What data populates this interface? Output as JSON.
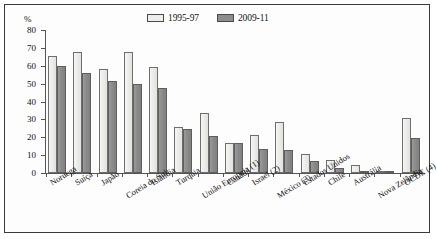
{
  "axis": {
    "unit_label": "%",
    "y_ticks": [
      0,
      10,
      20,
      30,
      40,
      50,
      60,
      70,
      80
    ],
    "ylim": [
      0,
      80
    ]
  },
  "legend": {
    "items": [
      {
        "label": "1995-97",
        "swatch": "light",
        "color": "#eeeeec"
      },
      {
        "label": "2009-11",
        "swatch": "dark",
        "color": "#8e8e8e"
      }
    ]
  },
  "chart_data": {
    "type": "bar",
    "title": "",
    "xlabel": "",
    "ylabel": "%",
    "ylim": [
      0,
      80
    ],
    "grid": false,
    "legend_position": "top-right",
    "categories": [
      "Noruega",
      "Suíça",
      "Japão",
      "Coreia do Sul",
      "Islândia",
      "Turquia",
      "União Europeia (1)",
      "Canadá",
      "Israel (2)",
      "México (3)",
      "Estados Unidos",
      "Chile",
      "Austrália",
      "Nova Zelândia",
      "OCDE (4)"
    ],
    "series": [
      {
        "name": "1995-97",
        "values": [
          65.5,
          67.5,
          58.0,
          67.5,
          59.5,
          25.5,
          33.5,
          17.0,
          21.0,
          28.5,
          10.5,
          7.5,
          4.5,
          1.0,
          30.5
        ]
      },
      {
        "name": "2009-11",
        "values": [
          60.0,
          56.0,
          51.5,
          50.0,
          47.5,
          24.5,
          20.5,
          17.0,
          13.5,
          13.0,
          6.5,
          3.0,
          1.0,
          0.8,
          19.5
        ]
      }
    ]
  }
}
